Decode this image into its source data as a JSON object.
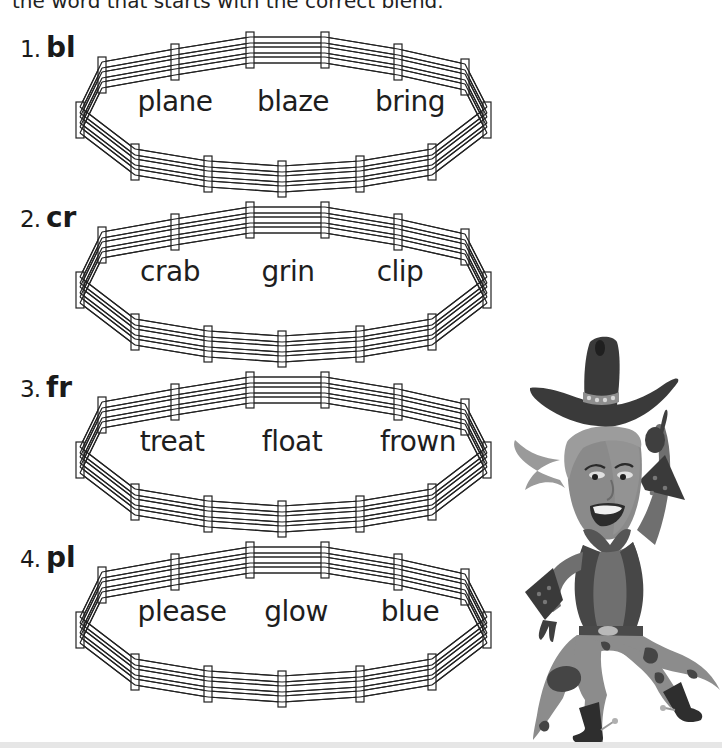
{
  "instruction": "the word that starts with the correct blend.",
  "problems": [
    {
      "number": "1.",
      "blend": "bl",
      "words": [
        "plane",
        "blaze",
        "bring"
      ]
    },
    {
      "number": "2.",
      "blend": "cr",
      "words": [
        "crab",
        "grin",
        "clip"
      ]
    },
    {
      "number": "3.",
      "blend": "fr",
      "words": [
        "treat",
        "float",
        "frown"
      ]
    },
    {
      "number": "4.",
      "blend": "pl",
      "words": [
        "please",
        "glow",
        "blue"
      ]
    }
  ],
  "illustration": {
    "subject": "cowboy-character",
    "colors": {
      "hat": "#3a3a3a",
      "face": "#8a8a8a",
      "hair": "#9a9a9a",
      "shirt": "#6f6f6f",
      "vest": "#4a4a4a",
      "pants": "#8c8c8c",
      "spots": "#454545",
      "boots": "#2e2e2e"
    }
  }
}
